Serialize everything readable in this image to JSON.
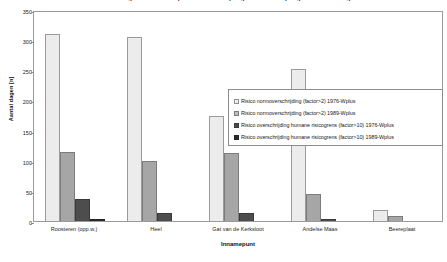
{
  "chart_data": {
    "type": "bar",
    "title": "Aantal dagen met risico op normoverschrijding en overschrijding humane risicogrenzen",
    "xlabel": "Innamepunt",
    "ylabel": "Aantal dagen [n]",
    "ylim": [
      0,
      350
    ],
    "yticks": [
      0,
      50,
      100,
      150,
      200,
      250,
      300,
      350
    ],
    "grid": false,
    "legend_position": "center-right",
    "categories": [
      "Roosteren (opp.w.)",
      "Heel",
      "Gat van de Kerksloot",
      "Andelse Maas",
      "Beereplaat"
    ],
    "series": [
      {
        "name": "Risico normoverschrijding (factor>2) 1976-Wplus",
        "color": "#ececec",
        "values": [
          310,
          305,
          175,
          252,
          18
        ]
      },
      {
        "name": "Risico normoverschrijding (factor>2) 1989-Wplus",
        "color": "#a6a6a6",
        "values": [
          115,
          100,
          112,
          45,
          9
        ]
      },
      {
        "name": "Risico overschrijding humane risicogrens (factor>10) 1976-Wplus",
        "color": "#4d4d4d",
        "values": [
          37,
          13,
          14,
          3,
          0
        ]
      },
      {
        "name": "Risico overschrijding humane risicogrens (factor>10) 1989-Wplus",
        "color": "#2b2b2b",
        "values": [
          3,
          0,
          0,
          0,
          0
        ]
      }
    ]
  },
  "legend": {
    "items": [
      {
        "label": "Risico normoverschrijding (factor>2) 1976-Wplus"
      },
      {
        "label": "Risico normoverschrijding (factor>2) 1989-Wplus"
      },
      {
        "label": "Risico overschrijding humane risicogrens (factor>10) 1976-Wplus"
      },
      {
        "label": "Risico overschrijding humane risicogrens (factor>10) 1989-Wplus"
      }
    ]
  }
}
